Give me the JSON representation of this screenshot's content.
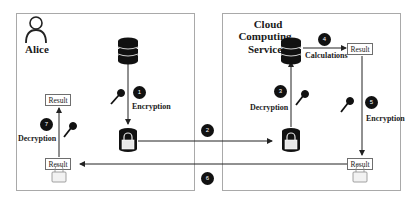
{
  "panels": {
    "alice": {
      "title": "Alice"
    },
    "cloud": {
      "title_lines": [
        "Cloud",
        "Computing",
        "Service"
      ]
    }
  },
  "labels": {
    "encryption_1": "Encryption",
    "decryption_3": "Decryption",
    "calculations_4": "Calculations",
    "encryption_5": "Encryption",
    "decryption_7": "Decryption"
  },
  "result_boxes": {
    "alice_top": "Result",
    "alice_bottom": "Result",
    "cloud_top": "Result",
    "cloud_bottom": "Result"
  },
  "steps": [
    "1",
    "2",
    "3",
    "4",
    "5",
    "6",
    "7"
  ],
  "icons": [
    "user-icon",
    "database-icon",
    "encrypted-database-icon",
    "key-icon",
    "padlock-icon"
  ],
  "colors": {
    "border": "#a9a9a9",
    "ink": "#111111",
    "background": "#ffffff"
  }
}
